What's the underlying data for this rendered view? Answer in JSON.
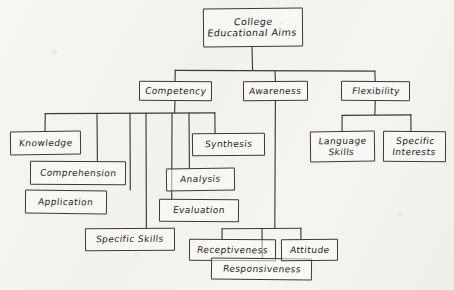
{
  "diagram": {
    "kind": "hand-drawn-hierarchy-tree",
    "title": "College Educational Aims",
    "ink_color": "#3a3a38",
    "paper_color": "#f4f3ef",
    "root": {
      "id": "root",
      "label": "College\nEducational Aims"
    },
    "level2": [
      {
        "id": "competency",
        "label": "Competency"
      },
      {
        "id": "awareness",
        "label": "Awareness"
      },
      {
        "id": "flexibility",
        "label": "Flexibility"
      }
    ],
    "competency_children": [
      {
        "id": "knowledge",
        "label": "Knowledge"
      },
      {
        "id": "comprehension",
        "label": "Comprehension"
      },
      {
        "id": "application",
        "label": "Application"
      },
      {
        "id": "specific-skills",
        "label": "Specific Skills"
      },
      {
        "id": "evaluation",
        "label": "Evaluation"
      },
      {
        "id": "analysis",
        "label": "Analysis"
      },
      {
        "id": "synthesis",
        "label": "Synthesis"
      }
    ],
    "awareness_children": [
      {
        "id": "receptiveness",
        "label": "Receptiveness"
      },
      {
        "id": "responsiveness",
        "label": "Responsiveness"
      },
      {
        "id": "attitude",
        "label": "Attitude"
      }
    ],
    "flexibility_children": [
      {
        "id": "language-skills",
        "label": "Language\nSkills"
      },
      {
        "id": "specific-interests",
        "label": "Specific\nInterests"
      }
    ]
  }
}
